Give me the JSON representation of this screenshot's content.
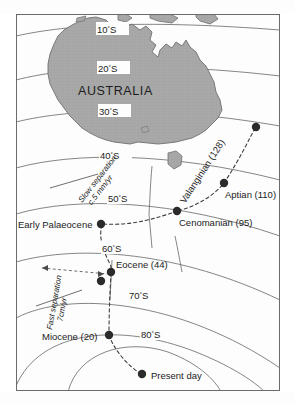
{
  "figure": {
    "title_text": "AUSTRALIA",
    "frame": {
      "color": "#6b6b6b"
    },
    "landmass": {
      "name": "AUSTRALIA",
      "fill": "#a9a9a9",
      "stroke": "#6f6f6f"
    },
    "latitude_labels": [
      {
        "id": "lat10",
        "value": "10",
        "suffix": "S",
        "text": "10°S"
      },
      {
        "id": "lat20",
        "value": "20",
        "suffix": "S",
        "text": "20°S"
      },
      {
        "id": "lat30",
        "value": "30",
        "suffix": "S",
        "text": "30°S"
      },
      {
        "id": "lat40",
        "value": "40",
        "suffix": "S",
        "text": "40°S"
      },
      {
        "id": "lat50",
        "value": "50",
        "suffix": "S",
        "text": "50°S"
      },
      {
        "id": "lat60",
        "value": "60",
        "suffix": "S",
        "text": "60°S"
      },
      {
        "id": "lat70",
        "value": "70",
        "suffix": "S",
        "text": "70°S"
      },
      {
        "id": "lat80",
        "value": "80",
        "suffix": "S",
        "text": "80°S"
      }
    ],
    "track_points": [
      {
        "id": "valanginian",
        "label": "Valanginian (128)",
        "age_ma": 128,
        "rotated": true
      },
      {
        "id": "aptian",
        "label": "Aptian (110)",
        "age_ma": 110,
        "rotated": false
      },
      {
        "id": "cenomanian",
        "label": "Cenomanian (95)",
        "age_ma": 95,
        "rotated": false
      },
      {
        "id": "early-palaeocene",
        "label": "Early Palaeocene",
        "age_ma": null,
        "rotated": false
      },
      {
        "id": "eocene",
        "label": "Eocene (44)",
        "age_ma": 44,
        "rotated": false
      },
      {
        "id": "miocene",
        "label": "Miocene (20)",
        "age_ma": 20,
        "rotated": false
      },
      {
        "id": "present-day",
        "label": "Present day",
        "age_ma": 0,
        "rotated": false
      }
    ],
    "rate_annotations": [
      {
        "id": "slow",
        "line1": "Slow separation",
        "line2": "c.5 mm/yr"
      },
      {
        "id": "fast",
        "line1": "Fast separation",
        "line2": "7cm/yr"
      }
    ],
    "colors": {
      "graticule": "#6f6f6f",
      "dashed_track": "#4a4a4a",
      "marker": "#2b2b2b",
      "text": "#1c1c1c"
    }
  }
}
